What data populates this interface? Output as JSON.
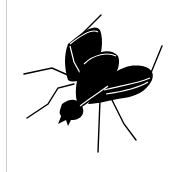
{
  "image": {
    "icon": "fly-icon",
    "colors": {
      "fill": "#000000",
      "background": "#ffffff",
      "border": "#cfcfcf"
    }
  }
}
